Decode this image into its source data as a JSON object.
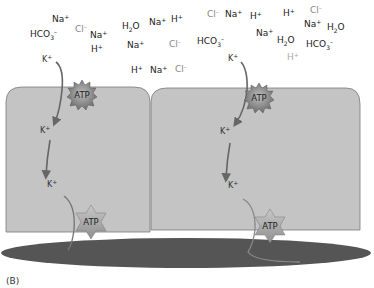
{
  "figure": {
    "panel_label": "(B)",
    "lumen_ions": [
      {
        "text": "Na",
        "sup": "+",
        "x": 52,
        "y": 22,
        "tone": "dark"
      },
      {
        "text": "HCO",
        "sub": "3",
        "sup": "–",
        "x": 30,
        "y": 37,
        "tone": "dark"
      },
      {
        "text": "Cl",
        "sup": "–",
        "x": 75,
        "y": 32,
        "tone": "light"
      },
      {
        "text": "Na",
        "sup": "+",
        "x": 90,
        "y": 38,
        "tone": "dark"
      },
      {
        "text": "H",
        "sup": "+",
        "x": 91,
        "y": 52,
        "tone": "dark"
      },
      {
        "text": "H",
        "sub": "2",
        "tail": "O",
        "x": 122,
        "y": 29,
        "tone": "dark"
      },
      {
        "text": "Na",
        "sup": "+",
        "x": 149,
        "y": 25,
        "tone": "dark"
      },
      {
        "text": "H",
        "sup": "+",
        "x": 171,
        "y": 22,
        "tone": "dark"
      },
      {
        "text": "Na",
        "sup": "+",
        "x": 127,
        "y": 48,
        "tone": "dark"
      },
      {
        "text": "Cl",
        "sup": "–",
        "x": 169,
        "y": 47,
        "tone": "light"
      },
      {
        "text": "H",
        "sup": "+",
        "x": 131,
        "y": 73,
        "tone": "dark"
      },
      {
        "text": "Na",
        "sup": "+",
        "x": 150,
        "y": 73,
        "tone": "dark"
      },
      {
        "text": "Cl",
        "sup": "–",
        "x": 175,
        "y": 72,
        "tone": "light"
      },
      {
        "text": "Cl",
        "sup": "–",
        "x": 207,
        "y": 17,
        "tone": "light"
      },
      {
        "text": "Na",
        "sup": "+",
        "x": 225,
        "y": 17,
        "tone": "dark"
      },
      {
        "text": "H",
        "sup": "+",
        "x": 250,
        "y": 19,
        "tone": "dark"
      },
      {
        "text": "H",
        "sup": "+",
        "x": 283,
        "y": 16,
        "tone": "dark"
      },
      {
        "text": "Cl",
        "sup": "–",
        "x": 310,
        "y": 13,
        "tone": "light"
      },
      {
        "text": "HCO",
        "sub": "3",
        "sup": "–",
        "x": 197,
        "y": 44,
        "tone": "dark"
      },
      {
        "text": "Na",
        "sup": "+",
        "x": 256,
        "y": 36,
        "tone": "dark"
      },
      {
        "text": "Na",
        "sup": "+",
        "x": 304,
        "y": 27,
        "tone": "dark"
      },
      {
        "text": "H",
        "sub": "2",
        "tail": "O",
        "x": 277,
        "y": 43,
        "tone": "dark"
      },
      {
        "text": "H",
        "sub": "2",
        "tail": "O",
        "x": 327,
        "y": 30,
        "tone": "dark"
      },
      {
        "text": "HCO",
        "sub": "3",
        "sup": "–",
        "x": 306,
        "y": 47,
        "tone": "dark"
      },
      {
        "text": "H",
        "sup": "+",
        "x": 287,
        "y": 60,
        "tone": "dim"
      }
    ],
    "cells": [
      {
        "name": "left-cell",
        "k_labels": [
          {
            "text": "K",
            "sup": "+",
            "x": 42,
            "y": 62
          },
          {
            "text": "K",
            "sup": "+",
            "x": 40,
            "y": 133
          },
          {
            "text": "K",
            "sup": "+",
            "x": 47,
            "y": 187
          }
        ],
        "apical_atp": {
          "label": "ATP",
          "x": 82,
          "y": 95
        },
        "basal_atp": {
          "label": "ATP",
          "x": 91,
          "y": 222
        }
      },
      {
        "name": "right-cell",
        "k_labels": [
          {
            "text": "K",
            "sup": "+",
            "x": 228,
            "y": 61
          },
          {
            "text": "K",
            "sup": "+",
            "x": 220,
            "y": 134
          },
          {
            "text": "K",
            "sup": "+",
            "x": 228,
            "y": 188
          }
        ],
        "apical_atp": {
          "label": "ATP",
          "x": 259,
          "y": 98
        },
        "basal_atp": {
          "label": "ATP",
          "x": 270,
          "y": 226
        }
      }
    ],
    "colors": {
      "cell_fill": "#c4c4c4",
      "cell_stroke": "#7a7a7a",
      "vessel_fill": "#555555",
      "arrow": "#666666",
      "atp_burst": "#8a8a8a",
      "atp_star": "#a9a9a9"
    }
  }
}
